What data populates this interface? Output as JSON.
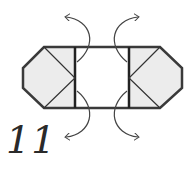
{
  "diagram": {
    "type": "origami-fold-step",
    "step_number": "11",
    "colors": {
      "outline": "#3a3a3a",
      "paper_fill": "#ececec",
      "center_fill": "#ffffff",
      "arrow": "#444444"
    },
    "arrows": [
      {
        "position": "top-left",
        "direction": "up-left"
      },
      {
        "position": "top-right",
        "direction": "up-right"
      },
      {
        "position": "bottom-left",
        "direction": "down-left"
      },
      {
        "position": "bottom-right",
        "direction": "down-right"
      }
    ]
  }
}
